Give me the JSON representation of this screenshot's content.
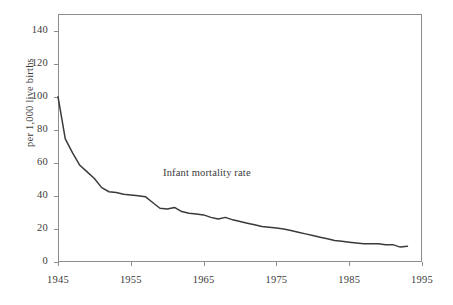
{
  "chart_data": {
    "type": "line",
    "title": "",
    "xlabel": "",
    "ylabel": "per 1,000 live births",
    "annotation": "Infant mortality rate",
    "xlim": [
      1945,
      1995
    ],
    "ylim": [
      0,
      150
    ],
    "xticks": [
      1945,
      1955,
      1965,
      1975,
      1985,
      1995
    ],
    "xtick_labels": [
      "1945",
      "1955",
      "1965",
      "1975",
      "1985",
      "1995"
    ],
    "yticks": [
      0,
      20,
      40,
      60,
      80,
      100,
      120,
      140
    ],
    "ytick_labels": [
      "0",
      "20",
      "40",
      "60",
      "80",
      "100",
      "120",
      "140"
    ],
    "grid": false,
    "legend": "none",
    "line_color": "#3a3a3a",
    "axis_color": "#8d8d8d",
    "background": "#ffffff",
    "series": [
      {
        "name": "Infant mortality rate",
        "x": [
          1945,
          1946,
          1947,
          1948,
          1949,
          1950,
          1951,
          1952,
          1953,
          1954,
          1955,
          1956,
          1957,
          1958,
          1959,
          1960,
          1961,
          1962,
          1963,
          1964,
          1965,
          1966,
          1967,
          1968,
          1969,
          1970,
          1971,
          1972,
          1973,
          1974,
          1975,
          1976,
          1977,
          1978,
          1979,
          1980,
          1981,
          1982,
          1983,
          1984,
          1985,
          1986,
          1987,
          1988,
          1989,
          1990,
          1991,
          1992,
          1993
        ],
        "values": [
          100.0,
          74.5,
          66.0,
          58.5,
          54.5,
          50.5,
          45.0,
          42.5,
          42.0,
          41.0,
          40.5,
          40.0,
          39.5,
          36.0,
          32.5,
          32.0,
          33.0,
          30.5,
          29.5,
          29.0,
          28.5,
          27.0,
          26.0,
          27.0,
          25.5,
          24.5,
          23.5,
          22.5,
          21.5,
          21.0,
          20.5,
          20.0,
          19.0,
          18.0,
          17.0,
          16.0,
          15.0,
          14.0,
          13.0,
          12.5,
          12.0,
          11.5,
          11.0,
          11.0,
          11.0,
          10.5,
          10.5,
          9.0,
          9.5
        ]
      }
    ]
  }
}
